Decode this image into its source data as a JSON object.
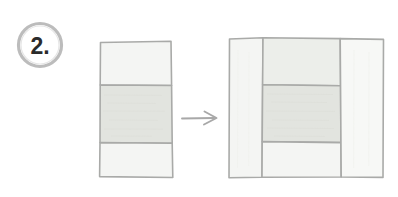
{
  "figure": {
    "kind": "instructional-construction-diagram",
    "style": "hand-drawn pencil sketch",
    "background_color": "#ffffff",
    "step": {
      "label": "2.",
      "badge_shape": "circle",
      "badge_outline_color": "#9a9a9a",
      "badge_text_color": "#2b2b2b",
      "badge_center": {
        "x": 40,
        "y": 45
      },
      "badge_radius": 21
    },
    "transition": {
      "icon": "arrow-right-icon",
      "color": "#a8a8a8",
      "from_x": 182,
      "to_x": 216,
      "y": 118
    },
    "colors": {
      "outline": "#a9aaa8",
      "outline_soft": "#b8b9b7",
      "fill_light": "#f4f5f3",
      "fill_lighter": "#f7f8f6",
      "fill_medium": "#eceeea",
      "fill_dark": "#e2e4df"
    },
    "shapes": [
      {
        "name": "before-block",
        "role": "starting strip-set unit",
        "description": "Tall vertical rectangle divided into three horizontal bands; the middle band is shaded darker.",
        "bounds": {
          "x": 99,
          "y": 41,
          "width": 73,
          "height": 137
        },
        "divider_orientation": "horizontal",
        "bands": [
          {
            "name": "top-band",
            "fill": "fill_light",
            "y_start": 41,
            "y_end": 85
          },
          {
            "name": "middle-band",
            "fill": "fill_dark",
            "y_start": 85,
            "y_end": 143
          },
          {
            "name": "bottom-band",
            "fill": "fill_light",
            "y_start": 143,
            "y_end": 178
          }
        ]
      },
      {
        "name": "after-block",
        "role": "resulting framed square block",
        "description": "Square divided into three vertical columns; the middle column is further split into three rows with the center cell shaded darker, forming a framed medallion.",
        "bounds": {
          "x": 228,
          "y": 37,
          "width": 156,
          "height": 141
        },
        "columns": [
          {
            "name": "left-column",
            "fill": "fill_light",
            "x_start": 228,
            "x_end": 263
          },
          {
            "name": "center-column",
            "x_start": 263,
            "x_end": 340,
            "rows": [
              {
                "name": "center-top-cell",
                "fill": "fill_medium",
                "y_start": 37,
                "y_end": 85
              },
              {
                "name": "center-middle-cell",
                "fill": "fill_dark",
                "y_start": 85,
                "y_end": 142
              },
              {
                "name": "center-bottom-cell",
                "fill": "fill_light",
                "y_start": 142,
                "y_end": 178
              }
            ]
          },
          {
            "name": "right-column",
            "fill": "fill_lighter",
            "x_start": 340,
            "x_end": 384
          }
        ]
      }
    ]
  }
}
